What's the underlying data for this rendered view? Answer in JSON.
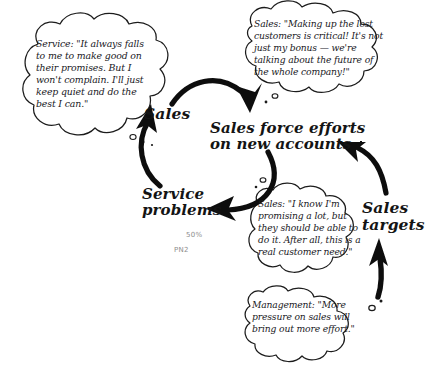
{
  "diagram": {
    "type": "causal-loop-diagram",
    "background_color": "#ffffff",
    "ink_color": "#141414",
    "pencil_color": "#8d8d8d"
  },
  "nodes": [
    {
      "id": "sales",
      "label": "Sales"
    },
    {
      "id": "sales_force_efforts",
      "label": "Sales force efforts\non new accounts"
    },
    {
      "id": "service_problems",
      "label": "Service\nproblems"
    },
    {
      "id": "sales_targets",
      "label": "Sales\ntargets"
    }
  ],
  "links": [
    {
      "from": "sales",
      "to": "sales_force_efforts"
    },
    {
      "from": "sales_force_efforts",
      "to": "service_problems"
    },
    {
      "from": "service_problems",
      "to": "sales"
    },
    {
      "from": "sales_targets",
      "to": "sales_force_efforts"
    },
    {
      "from": "management_pressure",
      "to": "sales_targets"
    }
  ],
  "thought_bubbles": [
    {
      "id": "service",
      "speaker": "Service",
      "text": "Service: \"It always falls to me to make good on their promises. But I won't complain. I'll just keep quiet and do the best I can.\"",
      "attached_to": "sales"
    },
    {
      "id": "sales_bonus",
      "speaker": "Sales",
      "text": "Sales: \"Making up the lost customers is critical! It's not just my bonus — we're talking about the future of the whole company!\"",
      "attached_to": "sales_force_efforts"
    },
    {
      "id": "sales_promise",
      "speaker": "Sales",
      "text": "Sales: \"I know I'm promising a lot, but they should be able to do it. After all, this is a real customer need.\"",
      "attached_to": "service_problems"
    },
    {
      "id": "management",
      "speaker": "Management",
      "text": "Management: \"More pressure on sales will bring out more effort.\"",
      "attached_to": "sales_targets"
    }
  ],
  "annotations": {
    "percent": "50%",
    "code": "PN2"
  }
}
